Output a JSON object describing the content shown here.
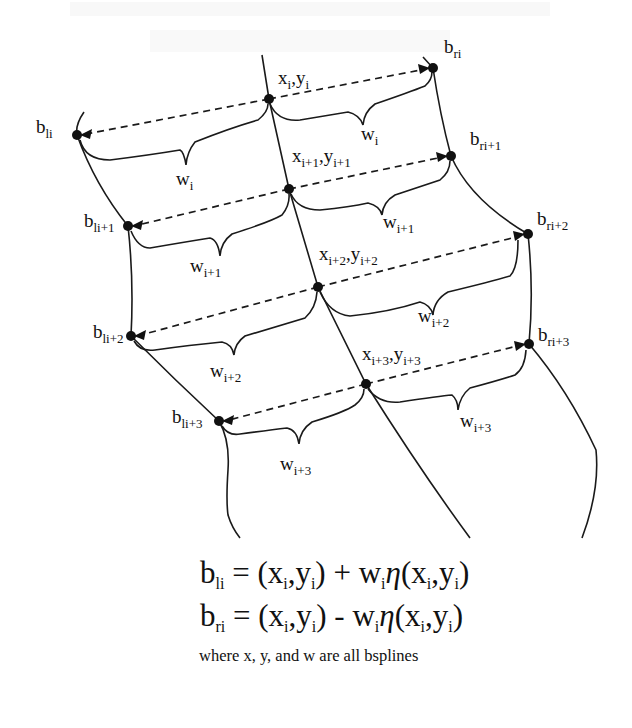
{
  "figure": {
    "watermark_lines": [
      "",
      ""
    ],
    "nodes": {
      "center": [
        {
          "id": "x_i",
          "x": 269,
          "y": 99,
          "label_main": "x",
          "label_sub": "i",
          "label_main2": ",y",
          "label_sub2": "i",
          "lx": 278,
          "ly": 84
        },
        {
          "id": "x_i+1",
          "x": 289,
          "y": 189,
          "label_main": "x",
          "label_sub": "i+1",
          "label_main2": ",y",
          "label_sub2": "i+1",
          "lx": 292,
          "ly": 160
        },
        {
          "id": "x_i+2",
          "x": 318,
          "y": 287,
          "label_main": "x",
          "label_sub": "i+2",
          "label_main2": ",y",
          "label_sub2": "i+2",
          "lx": 319,
          "ly": 258
        },
        {
          "id": "x_i+3",
          "x": 366,
          "y": 384,
          "label_main": "x",
          "label_sub": "i+3",
          "label_main2": ",y",
          "label_sub2": "i+3",
          "lx": 363,
          "ly": 358
        }
      ],
      "left": [
        {
          "id": "b_li",
          "x": 77,
          "y": 135,
          "label_main": "b",
          "label_sub": "li",
          "lx": 36,
          "ly": 133
        },
        {
          "id": "b_li+1",
          "x": 128,
          "y": 226,
          "label_main": "b",
          "label_sub": "li+1",
          "lx": 83,
          "ly": 226
        },
        {
          "id": "b_li+2",
          "x": 131,
          "y": 336,
          "label_main": "b",
          "label_sub": "li+2",
          "lx": 93,
          "ly": 337
        },
        {
          "id": "b_li+3",
          "x": 219,
          "y": 421,
          "label_main": "b",
          "label_sub": "li+3",
          "lx": 172,
          "ly": 422
        }
      ],
      "right": [
        {
          "id": "b_ri",
          "x": 433,
          "y": 68,
          "label_main": "b",
          "label_sub": "ri",
          "lx": 444,
          "ly": 53
        },
        {
          "id": "b_ri+1",
          "x": 451,
          "y": 156,
          "label_main": "b",
          "label_sub": "ri+1",
          "lx": 470,
          "ly": 144
        },
        {
          "id": "b_ri+2",
          "x": 528,
          "y": 234,
          "label_main": "b",
          "label_sub": "ri+2",
          "lx": 537,
          "ly": 224
        },
        {
          "id": "b_ri+3",
          "x": 529,
          "y": 344,
          "label_main": "b",
          "label_sub": "ri+3",
          "lx": 538,
          "ly": 340
        }
      ]
    },
    "width_labels": [
      {
        "side": "left",
        "main": "w",
        "sub": "i",
        "lx": 181,
        "ly": 185
      },
      {
        "side": "right",
        "main": "w",
        "sub": "i",
        "lx": 363,
        "ly": 138
      },
      {
        "side": "left",
        "main": "w",
        "sub": "i+1",
        "lx": 190,
        "ly": 272
      },
      {
        "side": "right",
        "main": "w",
        "sub": "i+1",
        "lx": 383,
        "ly": 226
      },
      {
        "side": "left",
        "main": "w",
        "sub": "i+2",
        "lx": 210,
        "ly": 376
      },
      {
        "side": "right",
        "main": "w",
        "sub": "i+2",
        "lx": 425,
        "ly": 320
      },
      {
        "side": "left",
        "main": "w",
        "sub": "i+3",
        "lx": 281,
        "ly": 469
      },
      {
        "side": "right",
        "main": "w",
        "sub": "i+3",
        "lx": 460,
        "ly": 426
      }
    ]
  },
  "equations": [
    {
      "lhs_main": "b",
      "lhs_sub": "li",
      "op": "+"
    },
    {
      "lhs_main": "b",
      "lhs_sub": "ri",
      "op": "-"
    }
  ],
  "equation_parts": {
    "eq": "=",
    "open": "(",
    "x": "x",
    "i": "i",
    "comma": ",",
    "y": "y",
    "close": ")",
    "w": "w",
    "eta": "η"
  },
  "caption": "where x, y, and w are all bsplines"
}
